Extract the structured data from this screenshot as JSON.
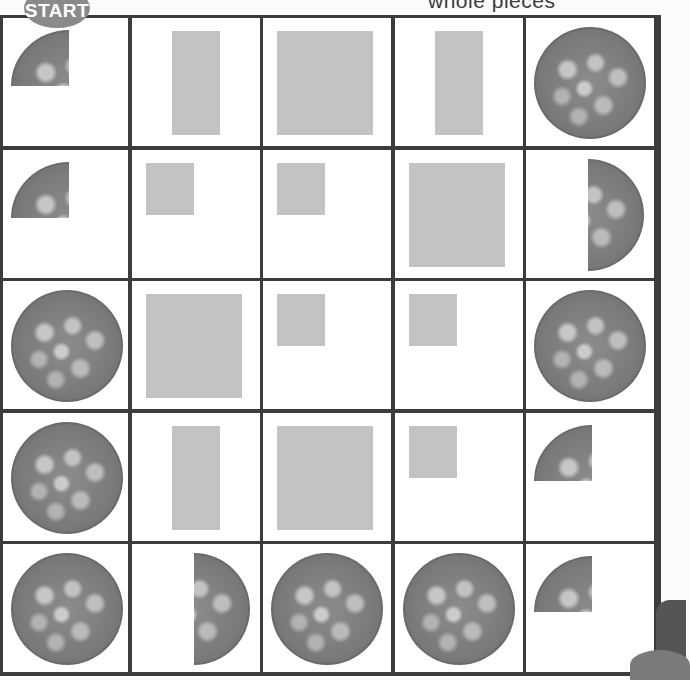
{
  "caption": "whole pieces",
  "start_label": "START",
  "colors": {
    "grid_line": "#3c3c3c",
    "square_fill": "#c3c3c3",
    "cracker": "#7a7a7a",
    "badge": "#8a8a8a"
  },
  "grid": {
    "rows": 5,
    "cols": 5,
    "cells": [
      [
        {
          "piece": "cracker-quarter"
        },
        {
          "piece": "tall-rectangle"
        },
        {
          "piece": "large-square"
        },
        {
          "piece": "tall-rectangle"
        },
        {
          "piece": "whole-cracker"
        }
      ],
      [
        {
          "piece": "cracker-quarter"
        },
        {
          "piece": "small-square"
        },
        {
          "piece": "small-square"
        },
        {
          "piece": "large-square"
        },
        {
          "piece": "cracker-half-right"
        }
      ],
      [
        {
          "piece": "whole-cracker"
        },
        {
          "piece": "large-square"
        },
        {
          "piece": "small-square"
        },
        {
          "piece": "small-square"
        },
        {
          "piece": "whole-cracker"
        }
      ],
      [
        {
          "piece": "whole-cracker"
        },
        {
          "piece": "tall-rectangle"
        },
        {
          "piece": "large-square"
        },
        {
          "piece": "small-square"
        },
        {
          "piece": "cracker-quarter"
        }
      ],
      [
        {
          "piece": "whole-cracker"
        },
        {
          "piece": "cracker-half-right"
        },
        {
          "piece": "whole-cracker"
        },
        {
          "piece": "whole-cracker"
        },
        {
          "piece": "cracker-quarter"
        }
      ]
    ]
  }
}
